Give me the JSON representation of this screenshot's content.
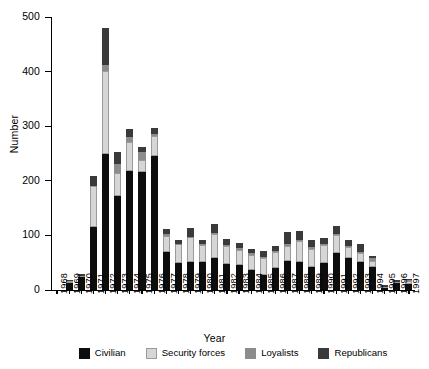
{
  "chart_data": {
    "type": "bar",
    "stacked": true,
    "title": "",
    "xlabel": "Year",
    "ylabel": "Number",
    "ylim": [
      0,
      500
    ],
    "yticks": [
      0,
      100,
      200,
      300,
      400,
      500
    ],
    "grid": false,
    "legend_position": "bottom",
    "categories": [
      "1968",
      "1969",
      "1970",
      "1971",
      "1972",
      "1973",
      "1974",
      "1975",
      "1976",
      "1977",
      "1978",
      "1979",
      "1980",
      "1981",
      "1982",
      "1983",
      "1984",
      "1985",
      "1986",
      "1987",
      "1988",
      "1989",
      "1990",
      "1991",
      "1992",
      "1993",
      "1994",
      "1995",
      "1996",
      "1997"
    ],
    "series": [
      {
        "name": "Civilian",
        "color": "#0d0d0d",
        "values": [
          0,
          13,
          23,
          115,
          250,
          172,
          218,
          217,
          245,
          69,
          50,
          51,
          52,
          58,
          48,
          45,
          36,
          28,
          41,
          53,
          51,
          43,
          49,
          67,
          58,
          51,
          42,
          4,
          12,
          11
        ]
      },
      {
        "name": "Security forces",
        "color": "#d6d6d6",
        "values": [
          0,
          3,
          2,
          76,
          151,
          43,
          54,
          22,
          37,
          30,
          34,
          46,
          31,
          44,
          32,
          29,
          28,
          31,
          28,
          28,
          39,
          33,
          34,
          33,
          20,
          17,
          12,
          1,
          3,
          5
        ]
      },
      {
        "name": "Loyalists",
        "color": "#8c8c8c",
        "values": [
          0,
          0,
          0,
          0,
          12,
          16,
          8,
          13,
          3,
          3,
          1,
          1,
          2,
          3,
          2,
          3,
          3,
          2,
          2,
          3,
          2,
          3,
          1,
          2,
          3,
          2,
          4,
          0,
          0,
          2
        ]
      },
      {
        "name": "Republicans",
        "color": "#3a3a3a",
        "values": [
          0,
          3,
          4,
          17,
          67,
          21,
          14,
          10,
          12,
          9,
          7,
          15,
          7,
          16,
          12,
          10,
          9,
          10,
          9,
          22,
          17,
          13,
          12,
          15,
          10,
          14,
          4,
          4,
          3,
          3
        ]
      }
    ]
  },
  "axes": {
    "y_label": "Number",
    "x_label": "Year",
    "y_tick_labels": [
      "0",
      "100",
      "200",
      "300",
      "400",
      "500"
    ]
  },
  "legend": {
    "items": [
      {
        "label": "Civilian",
        "color": "#0d0d0d"
      },
      {
        "label": "Security forces",
        "color": "#d6d6d6"
      },
      {
        "label": "Loyalists",
        "color": "#8c8c8c"
      },
      {
        "label": "Republicans",
        "color": "#3a3a3a"
      }
    ]
  }
}
